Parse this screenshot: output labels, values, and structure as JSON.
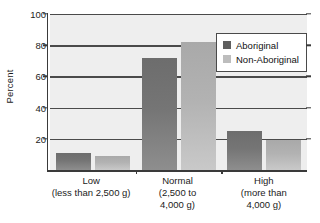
{
  "chart_data": {
    "type": "bar",
    "title": "",
    "xlabel": "",
    "ylabel": "Percent",
    "ylim": [
      0,
      100
    ],
    "yticks": [
      20,
      40,
      60,
      80,
      100
    ],
    "grid": true,
    "legend_position": "top-right",
    "categories": [
      "Low (less than 2,500 g)",
      "Normal (2,500 to 4,000 g)",
      "High (more than 4,000 g)"
    ],
    "series": [
      {
        "name": "Aboriginal",
        "values": [
          11,
          72,
          25
        ],
        "color": "#6d6d6d"
      },
      {
        "name": "Non-Aboriginal",
        "values": [
          9,
          82,
          19
        ],
        "color": "#b2b2b2"
      }
    ]
  },
  "axes": {
    "y_title": "Percent",
    "y_tick_labels": [
      "100",
      "80",
      "60",
      "40",
      "20"
    ],
    "x_categories": [
      {
        "name": "Low",
        "sub_line_1": "(less than 2,500 g)",
        "sub_line_2": ""
      },
      {
        "name": "Normal",
        "sub_line_1": "(2,500 to",
        "sub_line_2": "4,000 g)"
      },
      {
        "name": "High",
        "sub_line_1": "(more than",
        "sub_line_2": "4,000 g)"
      }
    ]
  },
  "legend": {
    "entries": [
      {
        "label": "Aboriginal"
      },
      {
        "label": "Non-Aboriginal"
      }
    ]
  },
  "colors": {
    "plot_background": "#eeeeee",
    "gridline": "#4a4a4a",
    "axis": "#3a3a3a",
    "series_aboriginal": "#6d6d6d",
    "series_non_aboriginal": "#b2b2b2",
    "text": "#1b1b1b"
  }
}
